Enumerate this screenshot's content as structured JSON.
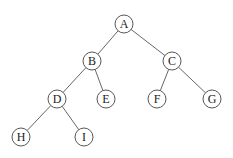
{
  "diagram": {
    "type": "binary-tree",
    "node_radius": 9,
    "stroke_color": "#444444",
    "nodes": [
      {
        "id": "A",
        "label": "A",
        "x": 124,
        "y": 24
      },
      {
        "id": "B",
        "label": "B",
        "x": 92,
        "y": 61
      },
      {
        "id": "C",
        "label": "C",
        "x": 172,
        "y": 61
      },
      {
        "id": "D",
        "label": "D",
        "x": 57,
        "y": 99
      },
      {
        "id": "E",
        "label": "E",
        "x": 106,
        "y": 99
      },
      {
        "id": "F",
        "label": "F",
        "x": 157,
        "y": 99
      },
      {
        "id": "G",
        "label": "G",
        "x": 212,
        "y": 99
      },
      {
        "id": "H",
        "label": "H",
        "x": 21,
        "y": 137
      },
      {
        "id": "I",
        "label": "I",
        "x": 84,
        "y": 137
      }
    ],
    "edges": [
      [
        "A",
        "B"
      ],
      [
        "A",
        "C"
      ],
      [
        "B",
        "D"
      ],
      [
        "B",
        "E"
      ],
      [
        "C",
        "F"
      ],
      [
        "C",
        "G"
      ],
      [
        "D",
        "H"
      ],
      [
        "D",
        "I"
      ]
    ]
  }
}
